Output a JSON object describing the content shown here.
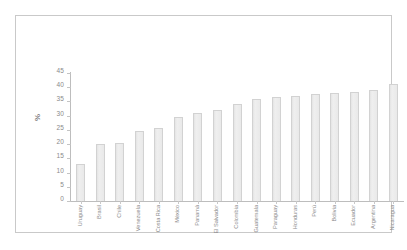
{
  "chart_data": {
    "type": "bar",
    "title": "",
    "subtitle": "",
    "xlabel": "",
    "ylabel": "%",
    "ylim": [
      0,
      45
    ],
    "yticks": [
      0,
      5,
      10,
      15,
      20,
      25,
      30,
      35,
      40,
      45
    ],
    "grid": false,
    "legend": null,
    "orientation": "vertical",
    "bar_color": "#e9e9e9",
    "bar_edge_color": "#d2d2d2",
    "categories": [
      "Uruguay",
      "Brasil",
      "Chile",
      "Venezuela",
      "Costa Rica",
      "México",
      "Panamá",
      "El Salvador",
      "Colombia",
      "Guatemala",
      "Paraguay",
      "Honduras",
      "Perú",
      "Bolivia",
      "Ecuador",
      "Argentina",
      "Nicaragua"
    ],
    "values": [
      13,
      20,
      20.5,
      24.5,
      25.5,
      29.5,
      31,
      32,
      34,
      36,
      36.5,
      37,
      37.5,
      37.8,
      38.3,
      39,
      41
    ]
  },
  "figure": {
    "background_color": "#ffffff",
    "frame_color": "#c9c9c9",
    "axis_color": "#bdbdbd",
    "tick_label_color": "#8a8a8a"
  }
}
